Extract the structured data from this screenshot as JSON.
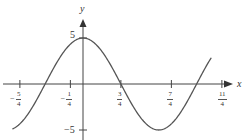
{
  "chart_data": {
    "type": "line",
    "title": "",
    "xlabel": "x",
    "ylabel": "y",
    "function": "y = 5cos(2πx/3)",
    "x_ticks": [
      {
        "value": -1.25,
        "label": "-5/4",
        "sign": "−",
        "num": "5",
        "den": "4"
      },
      {
        "value": -0.25,
        "label": "-1/4",
        "sign": "−",
        "num": "1",
        "den": "4"
      },
      {
        "value": 0.75,
        "label": "3/4",
        "sign": "",
        "num": "3",
        "den": "4"
      },
      {
        "value": 1.75,
        "label": "7/4",
        "sign": "",
        "num": "7",
        "den": "4"
      },
      {
        "value": 2.75,
        "label": "11/4",
        "sign": "",
        "num": "11",
        "den": "4"
      }
    ],
    "y_ticks": [
      {
        "value": 5,
        "label": "5"
      },
      {
        "value": -5,
        "label": "−5"
      }
    ],
    "xlim": [
      -1.55,
      3.25
    ],
    "ylim": [
      -5.5,
      6.5
    ],
    "series": [
      {
        "name": "curve",
        "x": [
          -1.4,
          -1.25,
          -1.0,
          -0.75,
          -0.5,
          -0.25,
          0,
          0.25,
          0.5,
          0.75,
          1.0,
          1.25,
          1.5,
          1.75,
          2.0,
          2.25,
          2.5,
          2.75
        ],
        "y": [
          -4.0,
          -2.5,
          -2.5,
          0,
          2.5,
          4.33,
          5,
          4.33,
          2.5,
          0,
          -2.5,
          -4.33,
          -5,
          -4.33,
          -2.5,
          0,
          2.5,
          4.33
        ]
      }
    ],
    "grid": false,
    "legend": null
  },
  "labels": {
    "x_axis": "x",
    "y_axis": "y",
    "y_max": "5",
    "y_min": "−5"
  },
  "colors": {
    "curve": "#555555",
    "axes": "#444444",
    "text": "#333333"
  }
}
